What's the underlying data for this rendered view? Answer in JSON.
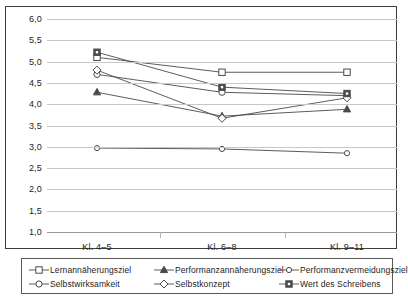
{
  "chart_data": {
    "type": "line",
    "title": "",
    "xlabel": "",
    "ylabel": "",
    "ylim": [
      1.0,
      6.0
    ],
    "ytick_step": 0.5,
    "grid": true,
    "legend_position": "bottom",
    "decimal_separator": ",",
    "categories": [
      "Kl. 4–5",
      "Kl. 6–8",
      "Kl. 9–11"
    ],
    "ytick_labels": [
      "6,0",
      "5,5",
      "5,0",
      "4,5",
      "4,0",
      "3,5",
      "3,0",
      "2,5",
      "2,0",
      "1,5",
      "1,0"
    ],
    "ytick_values": [
      6.0,
      5.5,
      5.0,
      4.5,
      4.0,
      3.5,
      3.0,
      2.5,
      2.0,
      1.5,
      1.0
    ],
    "series": [
      {
        "name": "Lernannäherungsziel",
        "marker": "open-square",
        "values": [
          5.1,
          4.75,
          4.75
        ]
      },
      {
        "name": "Performanzannäherungsziel",
        "marker": "filled-triangle",
        "values": [
          4.28,
          3.72,
          3.88
        ]
      },
      {
        "name": "Performanzvermeidungsziel",
        "marker": "open-circle-sm",
        "values": [
          2.97,
          2.95,
          2.85
        ]
      },
      {
        "name": "Selbstwirksamkeit",
        "marker": "open-circle",
        "values": [
          4.7,
          4.28,
          4.2
        ]
      },
      {
        "name": "Selbstkonzept",
        "marker": "open-diamond",
        "values": [
          4.8,
          3.67,
          4.15
        ]
      },
      {
        "name": "Wert des Schreibens",
        "marker": "filled-square",
        "values": [
          5.22,
          4.4,
          4.25
        ]
      }
    ],
    "line_color": "#4a4a4a",
    "grid_color": "#c8c8c8",
    "frame_color": "#3d3d3d"
  },
  "legend": {
    "entries": [
      {
        "label": "Lernannäherungsziel",
        "marker": "open-square"
      },
      {
        "label": "Performanzannäherungsziel",
        "marker": "filled-triangle"
      },
      {
        "label": "Performanzvermeidungsziel",
        "marker": "open-circle-sm"
      },
      {
        "label": "Selbstwirksamkeit",
        "marker": "open-circle"
      },
      {
        "label": "Selbstkonzept",
        "marker": "open-diamond"
      },
      {
        "label": "Wert des Schreibens",
        "marker": "filled-square"
      }
    ]
  }
}
